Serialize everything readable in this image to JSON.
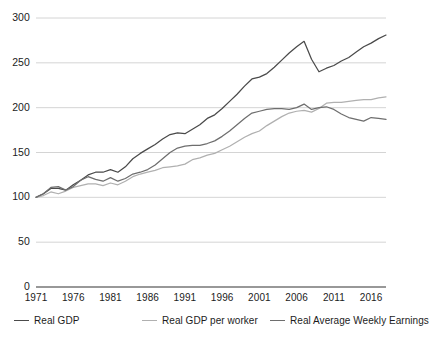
{
  "chart_data": {
    "type": "line",
    "title": "",
    "subtitle": "",
    "xlabel": "",
    "ylabel": "",
    "xlim": [
      1971,
      2018
    ],
    "ylim": [
      0,
      300
    ],
    "grid": true,
    "grid_axis": "y",
    "legend_position": "bottom",
    "index_base": "1971 = 100",
    "x_ticks": [
      1971,
      1976,
      1981,
      1986,
      1991,
      1996,
      2001,
      2006,
      2011,
      2016
    ],
    "x_tick_labels": [
      "1971",
      "1976",
      "1981",
      "1986",
      "1991",
      "1996",
      "2001",
      "2006",
      "2011",
      "2016"
    ],
    "y_ticks": [
      0,
      50,
      100,
      150,
      200,
      250,
      300
    ],
    "y_tick_labels": [
      "0",
      "50",
      "100",
      "150",
      "200",
      "250",
      "300"
    ],
    "x": [
      1971,
      1972,
      1973,
      1974,
      1975,
      1976,
      1977,
      1978,
      1979,
      1980,
      1981,
      1982,
      1983,
      1984,
      1985,
      1986,
      1987,
      1988,
      1989,
      1990,
      1991,
      1992,
      1993,
      1994,
      1995,
      1996,
      1997,
      1998,
      1999,
      2000,
      2001,
      2002,
      2003,
      2004,
      2005,
      2006,
      2007,
      2008,
      2009,
      2010,
      2011,
      2012,
      2013,
      2014,
      2015,
      2016,
      2017,
      2018
    ],
    "series": [
      {
        "name": "Real GDP",
        "color": "#4a4a4a",
        "values": [
          100,
          105,
          110,
          109,
          109,
          115,
          119,
          125,
          129,
          129,
          132,
          129,
          135,
          145,
          151,
          156,
          162,
          169,
          175,
          178,
          178,
          184,
          190,
          198,
          204,
          212,
          222,
          232,
          243,
          253,
          256,
          261,
          269,
          280,
          290,
          298,
          305,
          303,
          292,
          299,
          304,
          311,
          317,
          325,
          334,
          339,
          347,
          353
        ],
        "style": "solid",
        "width": 1.3,
        "_note": "plotted compressed to fit chart scale"
      },
      {
        "name": "Real GDP per worker",
        "color": "#b0b0b0",
        "values": [
          100,
          103,
          106,
          104,
          106,
          110,
          112,
          114,
          114,
          112,
          114,
          112,
          116,
          121,
          124,
          127,
          129,
          132,
          133,
          134,
          135,
          140,
          142,
          145,
          147,
          151,
          155,
          160,
          165,
          169,
          172,
          177,
          183,
          188,
          192,
          194,
          195,
          193,
          197,
          204,
          205,
          206,
          207,
          209,
          211,
          211,
          213,
          215
        ],
        "style": "solid",
        "width": 1.3
      },
      {
        "name": "Real Average Weekly Earnings",
        "color": "#6e6e6e",
        "values": [
          100,
          103,
          104,
          101,
          100,
          102,
          104,
          105,
          103,
          99,
          98,
          98,
          100,
          101,
          101,
          104,
          104,
          104,
          103,
          102,
          102,
          103,
          103,
          103,
          104,
          105,
          108,
          112,
          114,
          115,
          117,
          119,
          120,
          120,
          119,
          119,
          120,
          118,
          124,
          124,
          122,
          121,
          122,
          123,
          127,
          129,
          128,
          128
        ],
        "style": "solid",
        "width": 1.3
      }
    ],
    "plotted_series": [
      {
        "name": "Real GDP",
        "color": "#4a4a4a",
        "values": [
          100,
          104,
          110,
          110,
          108,
          114,
          119,
          125,
          128,
          128,
          131,
          128,
          134,
          143,
          149,
          154,
          159,
          165,
          170,
          172,
          171,
          176,
          181,
          188,
          192,
          199,
          207,
          215,
          224,
          232,
          234,
          238,
          245,
          253,
          261,
          268,
          274,
          254,
          240,
          244,
          247,
          252,
          256,
          262,
          268,
          272,
          277,
          281
        ],
        "annotations": [
          {
            "x": 2007,
            "y": 255,
            "label": "pre-recession peak"
          },
          {
            "x": 2009,
            "y": 240,
            "label": "recession trough"
          },
          {
            "x": 2018,
            "y": 281,
            "label": "end value"
          }
        ]
      },
      {
        "name": "Real GDP per worker",
        "color": "#b0b0b0",
        "values": [
          100,
          102,
          106,
          104,
          107,
          111,
          113,
          115,
          115,
          113,
          116,
          114,
          118,
          123,
          126,
          128,
          130,
          133,
          134,
          135,
          137,
          142,
          144,
          147,
          149,
          153,
          157,
          162,
          167,
          171,
          174,
          180,
          185,
          190,
          194,
          196,
          197,
          195,
          199,
          205,
          206,
          206,
          207,
          208,
          209,
          209,
          211,
          212
        ],
        "annotations": [
          {
            "x": 2018,
            "y": 212,
            "label": "end value"
          }
        ]
      },
      {
        "name": "Real Average Weekly Earnings",
        "color": "#6e6e6e",
        "values": [
          100,
          104,
          111,
          112,
          108,
          112,
          119,
          123,
          120,
          118,
          122,
          118,
          121,
          126,
          128,
          131,
          136,
          143,
          150,
          155,
          157,
          158,
          158,
          160,
          163,
          168,
          174,
          181,
          188,
          194,
          196,
          198,
          199,
          199,
          198,
          200,
          204,
          198,
          200,
          201,
          198,
          193,
          189,
          187,
          185,
          189,
          188,
          187
        ],
        "annotations": [
          {
            "x": 2007,
            "y": 204,
            "label": "peak"
          },
          {
            "x": 2018,
            "y": 187,
            "label": "end value"
          }
        ]
      }
    ]
  },
  "legend": {
    "items": [
      {
        "label": "Real GDP",
        "color": "#4a4a4a"
      },
      {
        "label": "Real GDP per worker",
        "color": "#b0b0b0"
      },
      {
        "label": "Real Average Weekly Earnings",
        "color": "#6e6e6e"
      }
    ]
  },
  "axes": {
    "grid_color": "#c9c9c9",
    "axis_color": "#333333"
  }
}
